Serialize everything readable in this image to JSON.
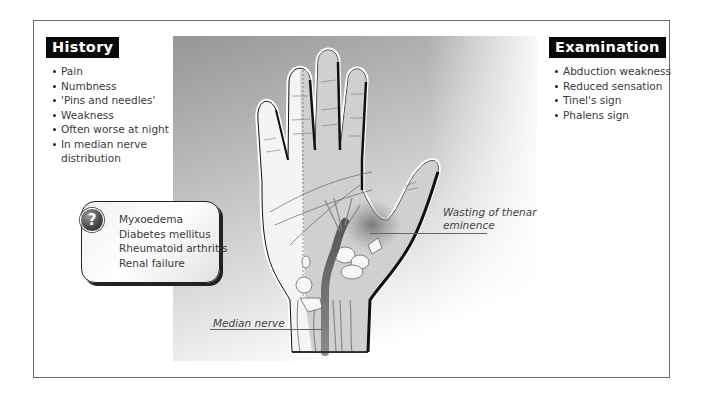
{
  "history": {
    "title": "History",
    "items": [
      "Pain",
      "Numbness",
      "'Pins and needles'",
      "Weakness",
      "Often worse at night",
      "In median nerve distribution"
    ]
  },
  "examination": {
    "title": "Examination",
    "items": [
      "Abduction weakness",
      "Reduced sensation",
      "Tinel's sign",
      "Phalens sign"
    ]
  },
  "causes": {
    "icon": "question-icon",
    "icon_glyph": "?",
    "items": [
      "Myxoedema",
      "Diabetes mellitus",
      "Rheumatoid arthritis",
      "Renal failure"
    ]
  },
  "labels": {
    "thenar": "Wasting of thenar eminence",
    "median": "Median nerve"
  },
  "colors": {
    "badge_bg": "#0a0a0a",
    "badge_text": "#ffffff",
    "nerve": "#7a7a7a",
    "panel_dark": "#969696"
  }
}
